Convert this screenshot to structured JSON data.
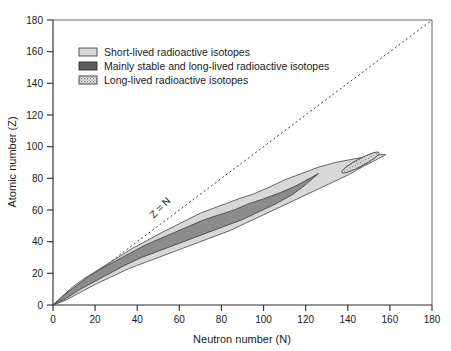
{
  "chart_data": {
    "type": "area",
    "title": "",
    "xlabel": "Neutron number (N)",
    "ylabel": "Atomic number (Z)",
    "xlim": [
      0,
      180
    ],
    "ylim": [
      0,
      180
    ],
    "xticks": [
      0,
      20,
      40,
      60,
      80,
      100,
      120,
      140,
      160,
      180
    ],
    "yticks": [
      0,
      20,
      40,
      60,
      80,
      100,
      120,
      140,
      160,
      180
    ],
    "grid": false,
    "legend_position": "top-left-inside",
    "legend": [
      "Short-lived radioactive isotopes",
      "Mainly stable and long-lived radioactive isotopes",
      "Long-lived radioactive isotopes"
    ],
    "annotations": [
      {
        "text": "Z = N",
        "x": 52,
        "y": 60,
        "rotation": -45
      }
    ],
    "reference_line": {
      "label": "Z = N",
      "style": "dotted",
      "from": [
        0,
        0
      ],
      "to": [
        180,
        180
      ]
    },
    "series": [
      {
        "name": "Short-lived radioactive isotopes",
        "fill": "#d8d8d8",
        "stroke": "#4d4d4d",
        "upper_boundary": [
          [
            0,
            0
          ],
          [
            4,
            5
          ],
          [
            9,
            11
          ],
          [
            14,
            16
          ],
          [
            20,
            21
          ],
          [
            26,
            26
          ],
          [
            32,
            31
          ],
          [
            38,
            36
          ],
          [
            45,
            41
          ],
          [
            52,
            46
          ],
          [
            58,
            50
          ],
          [
            64,
            54
          ],
          [
            70,
            58
          ],
          [
            76,
            61
          ],
          [
            82,
            64
          ],
          [
            88,
            67
          ],
          [
            95,
            70
          ],
          [
            102,
            74
          ],
          [
            110,
            79
          ],
          [
            118,
            83
          ],
          [
            126,
            87
          ],
          [
            134,
            90
          ],
          [
            142,
            92
          ],
          [
            150,
            94
          ],
          [
            156,
            95
          ],
          [
            158,
            95
          ]
        ],
        "lower_boundary": [
          [
            0,
            0
          ],
          [
            6,
            3
          ],
          [
            13,
            8
          ],
          [
            20,
            13
          ],
          [
            28,
            18
          ],
          [
            36,
            23
          ],
          [
            44,
            27
          ],
          [
            52,
            31
          ],
          [
            60,
            35
          ],
          [
            68,
            39
          ],
          [
            76,
            43
          ],
          [
            84,
            47
          ],
          [
            92,
            52
          ],
          [
            100,
            57
          ],
          [
            108,
            62
          ],
          [
            116,
            67
          ],
          [
            124,
            72
          ],
          [
            132,
            77
          ],
          [
            140,
            82
          ],
          [
            148,
            88
          ],
          [
            154,
            92
          ],
          [
            158,
            95
          ]
        ]
      },
      {
        "name": "Mainly stable and long-lived radioactive isotopes",
        "fill": "#8c8c8c",
        "stroke": "#3a3a3a",
        "upper_boundary": [
          [
            0,
            0
          ],
          [
            5,
            6
          ],
          [
            11,
            12
          ],
          [
            17,
            18
          ],
          [
            23,
            23
          ],
          [
            30,
            28
          ],
          [
            37,
            33
          ],
          [
            44,
            38
          ],
          [
            51,
            42
          ],
          [
            58,
            46
          ],
          [
            65,
            50
          ],
          [
            72,
            54
          ],
          [
            79,
            57
          ],
          [
            86,
            60
          ],
          [
            93,
            64
          ],
          [
            100,
            67
          ],
          [
            108,
            71
          ],
          [
            115,
            75
          ],
          [
            122,
            80
          ],
          [
            126,
            83
          ]
        ],
        "lower_boundary": [
          [
            0,
            0
          ],
          [
            6,
            4
          ],
          [
            13,
            10
          ],
          [
            20,
            15
          ],
          [
            27,
            20
          ],
          [
            34,
            25
          ],
          [
            42,
            30
          ],
          [
            50,
            34
          ],
          [
            58,
            38
          ],
          [
            66,
            42
          ],
          [
            74,
            46
          ],
          [
            82,
            50
          ],
          [
            90,
            54
          ],
          [
            98,
            59
          ],
          [
            106,
            64
          ],
          [
            114,
            70
          ],
          [
            120,
            76
          ],
          [
            126,
            83
          ]
        ]
      },
      {
        "name": "Long-lived radioactive isotopes",
        "fill": "#e6e6e6",
        "stroke": "#3a3a3a",
        "pattern": "stipple",
        "island": {
          "center_n": 146,
          "center_z": 90,
          "half_length": 10,
          "half_width": 2.4,
          "angle_deg": -28
        }
      }
    ]
  },
  "axes": {
    "x_title": "Neutron number (N)",
    "y_title": "Atomic number (Z)",
    "x_tick_labels": [
      "0",
      "20",
      "40",
      "60",
      "80",
      "100",
      "120",
      "140",
      "160",
      "180"
    ],
    "y_tick_labels": [
      "0",
      "20",
      "40",
      "60",
      "80",
      "100",
      "120",
      "140",
      "160",
      "180"
    ]
  },
  "legend": {
    "items": [
      {
        "label": "Short-lived radioactive isotopes",
        "swatch": "light-gray-swatch"
      },
      {
        "label": "Mainly stable and long-lived radioactive isotopes",
        "swatch": "dark-gray-swatch"
      },
      {
        "label": "Long-lived radioactive isotopes",
        "swatch": "stippled-swatch"
      }
    ]
  },
  "colors": {
    "short_lived": "#d8d8d8",
    "mainly_stable": "#8c8c8c",
    "long_lived": "#e6e6e6",
    "axis": "#2b2b2b",
    "text": "#1a1a1a"
  }
}
